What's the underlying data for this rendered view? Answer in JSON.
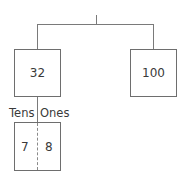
{
  "diagram": {
    "type": "number-bond-tree",
    "root": {
      "children": [
        {
          "value": "32",
          "place_value": {
            "tens_label": "Tens",
            "ones_label": "Ones",
            "tens_digit": "7",
            "ones_digit": "8"
          }
        },
        {
          "value": "100"
        }
      ]
    },
    "colors": {
      "line": "#7a7a7a",
      "box_border": "#6e6e6e",
      "text": "#3a3a3a",
      "background": "#ffffff"
    }
  }
}
